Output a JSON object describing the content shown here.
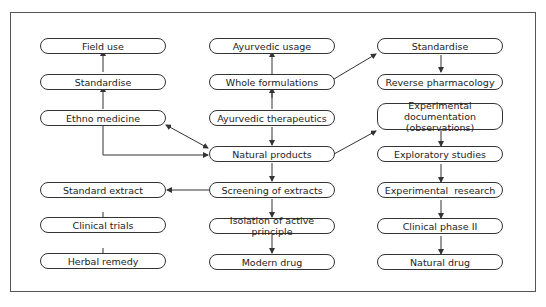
{
  "diagram": {
    "nodes": {
      "field_use": "Field use",
      "standardise_left": "Standardise",
      "ethno_medicine": "Ethno medicine",
      "standard_extract": "Standard extract",
      "clinical_trials": "Clinical trials",
      "herbal_remedy": "Herbal remedy",
      "ayurvedic_usage": "Ayurvedic usage",
      "whole_formulations": "Whole formulations",
      "ayurvedic_therapeutics": "Ayurvedic therapeutics",
      "natural_products": "Natural products",
      "screening_of_extracts": "Screening of extracts",
      "isolation_of_active_principle": "Isolation of active principle",
      "modern_drug": "Modern drug",
      "standardise_right": "Standardise",
      "reverse_pharmacology": "Reverse pharmacology",
      "experimental_documentation": "Experimental documentation (observations)",
      "exploratory_studies": "Exploratory studies",
      "experimental_research": "Experimental  research",
      "clinical_phase_ii": "Clinical phase II",
      "natural_drug": "Natural drug"
    },
    "edges": [
      [
        "Standardise (left)",
        "Field use"
      ],
      [
        "Ethno medicine",
        "Standardise (left)"
      ],
      [
        "Ethno medicine",
        "Natural products",
        "bidirectional"
      ],
      [
        "Ethno medicine",
        "Natural products",
        "elbow"
      ],
      [
        "Whole formulations",
        "Ayurvedic usage"
      ],
      [
        "Ayurvedic therapeutics",
        "Whole formulations"
      ],
      [
        "Ayurvedic therapeutics",
        "Natural products"
      ],
      [
        "Whole formulations",
        "Standardise (right)"
      ],
      [
        "Standardise (right)",
        "Reverse pharmacology"
      ],
      [
        "Natural products",
        "Experimental documentation"
      ],
      [
        "Experimental documentation",
        "Exploratory studies"
      ],
      [
        "Exploratory studies",
        "Experimental research"
      ],
      [
        "Experimental research",
        "Clinical phase II"
      ],
      [
        "Clinical phase II",
        "Natural drug"
      ],
      [
        "Natural products",
        "Screening of extracts"
      ],
      [
        "Screening of extracts",
        "Standard extract"
      ],
      [
        "Screening of extracts",
        "Isolation of active principle"
      ],
      [
        "Isolation of active principle",
        "Modern drug"
      ],
      [
        "Standard extract",
        "Clinical trials"
      ],
      [
        "Clinical trials",
        "Herbal remedy"
      ]
    ]
  }
}
